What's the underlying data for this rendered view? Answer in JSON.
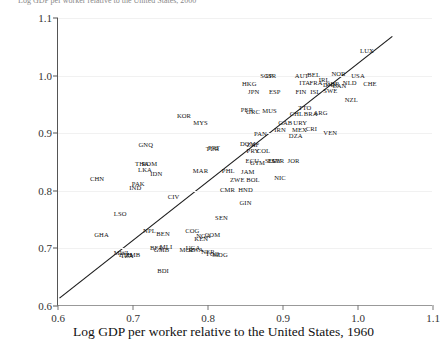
{
  "figure": {
    "clipped_top_text": "Log GDP per worker relative to the United States, 2000",
    "xlabel": "Log GDP per worker relative to the United States, 1960",
    "ylabel": ""
  },
  "chart_data": {
    "type": "scatter",
    "title": "",
    "xlabel": "Log GDP per worker relative to the United States, 1960",
    "ylabel": "Log GDP per worker relative to the United States, 2000",
    "xlim": [
      0.6,
      1.1
    ],
    "ylim": [
      0.6,
      1.1
    ],
    "xticks": [
      "0.6",
      "0.7",
      "0.8",
      "0.9",
      "1.0",
      "1.1"
    ],
    "yticks": [
      "0.6",
      "0.7",
      "0.8",
      "0.9",
      "1.0",
      "1.1"
    ],
    "grid": true,
    "legend": "none",
    "fit_line": {
      "x0": 0.602,
      "y0": 0.612,
      "x1": 1.047,
      "y1": 1.068
    },
    "point_label_type": "iso3-country-code",
    "points": [
      {
        "label": "LUX",
        "x": 1.012,
        "y": 1.042
      },
      {
        "label": "USA",
        "x": 1.0,
        "y": 1.0
      },
      {
        "label": "NOR",
        "x": 0.974,
        "y": 1.002
      },
      {
        "label": "CHE",
        "x": 1.016,
        "y": 0.985
      },
      {
        "label": "NLD",
        "x": 0.989,
        "y": 0.988
      },
      {
        "label": "CAN",
        "x": 0.975,
        "y": 0.982
      },
      {
        "label": "DNK",
        "x": 0.963,
        "y": 0.983
      },
      {
        "label": "AUT",
        "x": 0.925,
        "y": 1.0
      },
      {
        "label": "BEL",
        "x": 0.941,
        "y": 1.001
      },
      {
        "label": "FRA",
        "x": 0.944,
        "y": 0.988
      },
      {
        "label": "ITA",
        "x": 0.929,
        "y": 0.987
      },
      {
        "label": "GBR",
        "x": 0.966,
        "y": 0.986
      },
      {
        "label": "IRL",
        "x": 0.955,
        "y": 0.992
      },
      {
        "label": "SWE",
        "x": 0.963,
        "y": 0.973
      },
      {
        "label": "ISL",
        "x": 0.943,
        "y": 0.972
      },
      {
        "label": "FIN",
        "x": 0.924,
        "y": 0.972
      },
      {
        "label": "ESP",
        "x": 0.889,
        "y": 0.972
      },
      {
        "label": "JPN",
        "x": 0.861,
        "y": 0.972
      },
      {
        "label": "HKG",
        "x": 0.855,
        "y": 0.985
      },
      {
        "label": "SGP",
        "x": 0.878,
        "y": 1.0
      },
      {
        "label": "ISR",
        "x": 0.884,
        "y": 1.0
      },
      {
        "label": "NZL",
        "x": 0.991,
        "y": 0.958
      },
      {
        "label": "TTO",
        "x": 0.929,
        "y": 0.943
      },
      {
        "label": "MUS",
        "x": 0.882,
        "y": 0.938
      },
      {
        "label": "PER",
        "x": 0.852,
        "y": 0.941
      },
      {
        "label": "GRC",
        "x": 0.86,
        "y": 0.937
      },
      {
        "label": "CHL",
        "x": 0.918,
        "y": 0.933
      },
      {
        "label": "BRA",
        "x": 0.937,
        "y": 0.934
      },
      {
        "label": "ARG",
        "x": 0.95,
        "y": 0.935
      },
      {
        "label": "KOR",
        "x": 0.768,
        "y": 0.929
      },
      {
        "label": "MYS",
        "x": 0.79,
        "y": 0.918
      },
      {
        "label": "URY",
        "x": 0.923,
        "y": 0.918
      },
      {
        "label": "GAB",
        "x": 0.903,
        "y": 0.917
      },
      {
        "label": "CRI",
        "x": 0.938,
        "y": 0.908
      },
      {
        "label": "MEX",
        "x": 0.922,
        "y": 0.906
      },
      {
        "label": "VEN",
        "x": 0.963,
        "y": 0.901
      },
      {
        "label": "IRN",
        "x": 0.896,
        "y": 0.906
      },
      {
        "label": "DZA",
        "x": 0.917,
        "y": 0.895
      },
      {
        "label": "PAN",
        "x": 0.87,
        "y": 0.898
      },
      {
        "label": "GNQ",
        "x": 0.717,
        "y": 0.879
      },
      {
        "label": "TUR",
        "x": 0.806,
        "y": 0.872
      },
      {
        "label": "PRT",
        "x": 0.808,
        "y": 0.874
      },
      {
        "label": "DOM",
        "x": 0.853,
        "y": 0.882
      },
      {
        "label": "ZAF",
        "x": 0.86,
        "y": 0.88
      },
      {
        "label": "PRY",
        "x": 0.86,
        "y": 0.869
      },
      {
        "label": "COL",
        "x": 0.874,
        "y": 0.869
      },
      {
        "label": "JOR",
        "x": 0.914,
        "y": 0.852
      },
      {
        "label": "ECU",
        "x": 0.859,
        "y": 0.851
      },
      {
        "label": "GTM",
        "x": 0.866,
        "y": 0.849
      },
      {
        "label": "SLV",
        "x": 0.884,
        "y": 0.851
      },
      {
        "label": "EGY",
        "x": 0.889,
        "y": 0.852
      },
      {
        "label": "SYR",
        "x": 0.893,
        "y": 0.851
      },
      {
        "label": "THA",
        "x": 0.712,
        "y": 0.846
      },
      {
        "label": "ROM",
        "x": 0.722,
        "y": 0.846
      },
      {
        "label": "LKA",
        "x": 0.716,
        "y": 0.836
      },
      {
        "label": "IDN",
        "x": 0.731,
        "y": 0.829
      },
      {
        "label": "MAR",
        "x": 0.79,
        "y": 0.834
      },
      {
        "label": "PHL",
        "x": 0.827,
        "y": 0.834
      },
      {
        "label": "JAM",
        "x": 0.853,
        "y": 0.833
      },
      {
        "label": "NIC",
        "x": 0.896,
        "y": 0.822
      },
      {
        "label": "ZWE",
        "x": 0.839,
        "y": 0.819
      },
      {
        "label": "BOL",
        "x": 0.86,
        "y": 0.818
      },
      {
        "label": "CHN",
        "x": 0.652,
        "y": 0.82
      },
      {
        "label": "PAK",
        "x": 0.707,
        "y": 0.812
      },
      {
        "label": "IND",
        "x": 0.703,
        "y": 0.805
      },
      {
        "label": "CMR",
        "x": 0.826,
        "y": 0.802
      },
      {
        "label": "HND",
        "x": 0.85,
        "y": 0.802
      },
      {
        "label": "CIV",
        "x": 0.754,
        "y": 0.789
      },
      {
        "label": "GIN",
        "x": 0.85,
        "y": 0.778
      },
      {
        "label": "LSO",
        "x": 0.683,
        "y": 0.76
      },
      {
        "label": "SEN",
        "x": 0.818,
        "y": 0.752
      },
      {
        "label": "NPL",
        "x": 0.722,
        "y": 0.73
      },
      {
        "label": "BEN",
        "x": 0.74,
        "y": 0.725
      },
      {
        "label": "COG",
        "x": 0.779,
        "y": 0.731
      },
      {
        "label": "GHA",
        "x": 0.658,
        "y": 0.724
      },
      {
        "label": "NGA",
        "x": 0.794,
        "y": 0.722
      },
      {
        "label": "COM",
        "x": 0.806,
        "y": 0.724
      },
      {
        "label": "KEN",
        "x": 0.791,
        "y": 0.716
      },
      {
        "label": "MLI",
        "x": 0.744,
        "y": 0.702
      },
      {
        "label": "GMB",
        "x": 0.738,
        "y": 0.698
      },
      {
        "label": "BFA",
        "x": 0.731,
        "y": 0.7
      },
      {
        "label": "ETH",
        "x": 0.69,
        "y": 0.689
      },
      {
        "label": "MWI",
        "x": 0.684,
        "y": 0.692
      },
      {
        "label": "ZMB",
        "x": 0.7,
        "y": 0.688
      },
      {
        "label": "TZA",
        "x": 0.692,
        "y": 0.687
      },
      {
        "label": "UGA",
        "x": 0.78,
        "y": 0.7
      },
      {
        "label": "RWA",
        "x": 0.784,
        "y": 0.697
      },
      {
        "label": "MOZ",
        "x": 0.772,
        "y": 0.698
      },
      {
        "label": "NER",
        "x": 0.8,
        "y": 0.694
      },
      {
        "label": "TGO",
        "x": 0.806,
        "y": 0.69
      },
      {
        "label": "MDG",
        "x": 0.816,
        "y": 0.688
      },
      {
        "label": "BDI",
        "x": 0.74,
        "y": 0.661
      }
    ]
  }
}
